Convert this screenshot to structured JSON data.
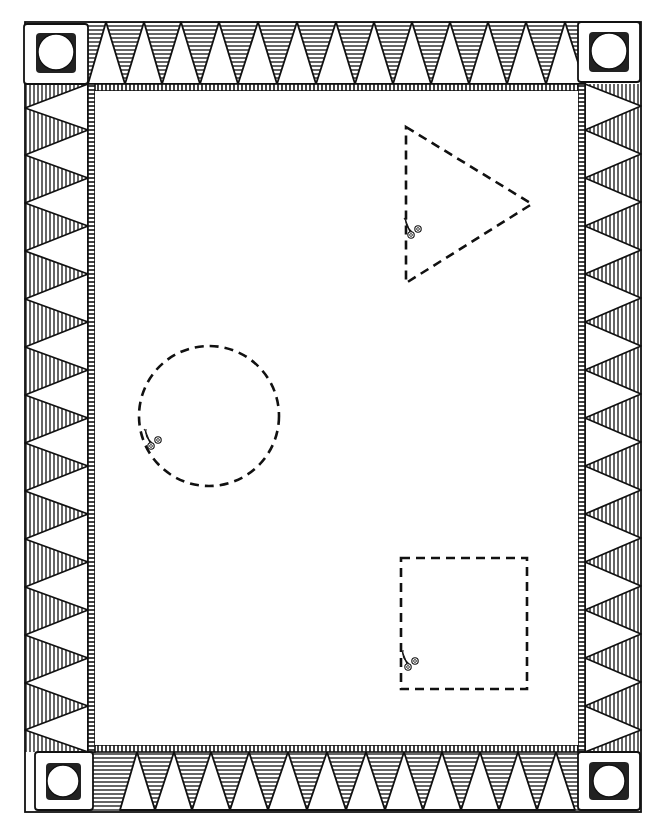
{
  "page": {
    "kind": "cut-out shapes worksheet",
    "ink_color": "#111111",
    "paper_color": "#ffffff"
  },
  "border": {
    "style": "hand-drawn hatched triangle border",
    "top_triangles": 11,
    "bottom_triangles": 11,
    "side_triangles": 14,
    "corner_ornament": "square-with-circle"
  },
  "shapes": [
    {
      "name": "triangle",
      "outline": "dashed",
      "icon": "scissors-icon"
    },
    {
      "name": "circle",
      "outline": "dashed",
      "icon": "scissors-icon"
    },
    {
      "name": "square",
      "outline": "dashed",
      "icon": "scissors-icon"
    }
  ]
}
